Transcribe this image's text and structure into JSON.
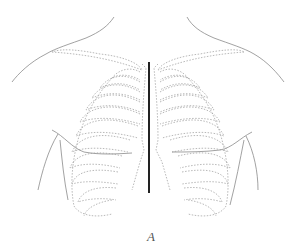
{
  "figure": {
    "type": "anatomical line illustration",
    "label": "A",
    "top_text_clipped": "",
    "colors": {
      "outline": "#888888",
      "dotted_bones": "#999999",
      "midline": "#222222",
      "background": "#ffffff"
    }
  }
}
